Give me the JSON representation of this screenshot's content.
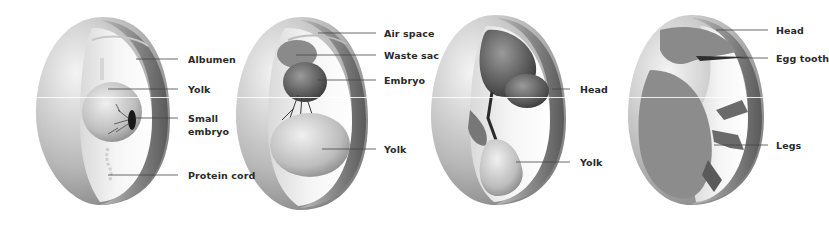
{
  "diagram": {
    "stages": [
      {
        "id": "stage-1",
        "labels": [
          "Albumen",
          "Yolk",
          "Small\nembryo",
          "Protein cord"
        ]
      },
      {
        "id": "stage-2",
        "labels": [
          "Air space",
          "Waste sac",
          "Embryo",
          "Yolk"
        ]
      },
      {
        "id": "stage-3",
        "labels": [
          "Head",
          "Yolk"
        ]
      },
      {
        "id": "stage-4",
        "labels": [
          "Head",
          "Egg tooth",
          "Legs"
        ]
      }
    ]
  },
  "labels": {
    "s1_albumen": "Albumen",
    "s1_yolk": "Yolk",
    "s1_small": "Small",
    "s1_embryo": "embryo",
    "s1_protein_cord": "Protein cord",
    "s2_air_space": "Air space",
    "s2_waste_sac": "Waste sac",
    "s2_embryo": "Embryo",
    "s2_yolk": "Yolk",
    "s3_head": "Head",
    "s3_yolk": "Yolk",
    "s4_head": "Head",
    "s4_egg_tooth": "Egg tooth",
    "s4_legs": "Legs"
  },
  "colors": {
    "shell": "#9a9a9a",
    "shell_light": "#e8e8e8",
    "interior": "#f2f2f2",
    "yolk": "#cfcfcf",
    "embryo_dark": "#3a3a3a",
    "label_text": "#2a2a2a",
    "leader_line": "#444444"
  }
}
